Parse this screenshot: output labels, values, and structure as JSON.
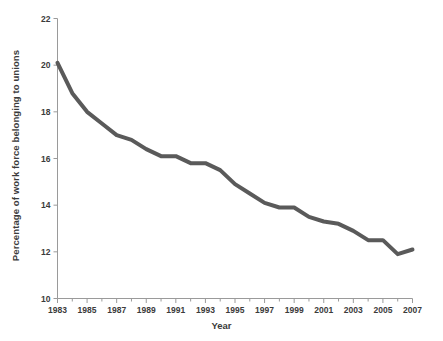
{
  "chart_data": {
    "type": "line",
    "title": "",
    "xlabel": "Year",
    "ylabel": "Percentage of work force belonging to unions",
    "xlim": [
      1983,
      2007
    ],
    "ylim": [
      10,
      22
    ],
    "grid": false,
    "legend": "none",
    "line_color": "#5a5a5a",
    "line_width": 4,
    "background_color": "#ffffff",
    "axis_color": "#9a9a9a",
    "text_color": "#3b3b3b",
    "x_tick_labels": [
      "1983",
      "1985",
      "1987",
      "1989",
      "1991",
      "1993",
      "1995",
      "1997",
      "1999",
      "2001",
      "2003",
      "2005",
      "2007"
    ],
    "x_tick_label_step": 2,
    "x_minor_tick_step": 1,
    "y_tick_labels": [
      "10",
      "12",
      "14",
      "16",
      "18",
      "20",
      "22"
    ],
    "y_tick_values": [
      10,
      12,
      14,
      16,
      18,
      20,
      22
    ],
    "x": [
      1983,
      1984,
      1985,
      1986,
      1987,
      1988,
      1989,
      1990,
      1991,
      1992,
      1993,
      1994,
      1995,
      1996,
      1997,
      1998,
      1999,
      2000,
      2001,
      2002,
      2003,
      2004,
      2005,
      2006,
      2007
    ],
    "values": [
      20.1,
      18.8,
      18.0,
      17.5,
      17.0,
      16.8,
      16.4,
      16.1,
      16.1,
      15.8,
      15.8,
      15.5,
      14.9,
      14.5,
      14.1,
      13.9,
      13.9,
      13.5,
      13.3,
      13.2,
      12.9,
      12.5,
      12.5,
      11.9,
      12.1
    ],
    "series": [
      {
        "name": "Percentage of work force belonging to unions",
        "values": [
          20.1,
          18.8,
          18.0,
          17.5,
          17.0,
          16.8,
          16.4,
          16.1,
          16.1,
          15.8,
          15.8,
          15.5,
          14.9,
          14.5,
          14.1,
          13.9,
          13.9,
          13.5,
          13.3,
          13.2,
          12.9,
          12.5,
          12.5,
          11.9,
          12.1
        ]
      }
    ]
  }
}
